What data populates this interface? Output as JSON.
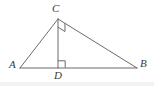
{
  "figure": {
    "background_color": "#ffffff",
    "stroke_color": "#5a5a5a",
    "label_color": "#3a3a3a",
    "labels": {
      "A": "A",
      "B": "B",
      "C": "C",
      "D": "D"
    },
    "points": {
      "A": {
        "x": 20,
        "y": 68
      },
      "B": {
        "x": 137,
        "y": 68
      },
      "C": {
        "x": 58,
        "y": 19
      },
      "D": {
        "x": 58,
        "y": 68
      }
    },
    "segments": [
      {
        "name": "AB",
        "from": "A",
        "to": "B"
      },
      {
        "name": "AC",
        "from": "A",
        "to": "C"
      },
      {
        "name": "CB",
        "from": "C",
        "to": "B"
      },
      {
        "name": "CD",
        "from": "C",
        "to": "D"
      }
    ],
    "right_angle_marks": [
      {
        "name": "right-angle-at-D",
        "vertex": "D",
        "between": [
          "DC",
          "DB"
        ]
      },
      {
        "name": "right-angle-at-C",
        "vertex": "C",
        "between": [
          "CD",
          "CB"
        ]
      }
    ]
  }
}
